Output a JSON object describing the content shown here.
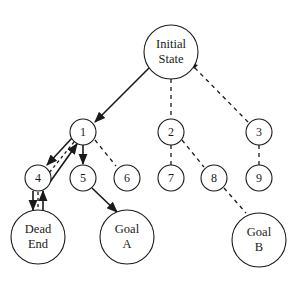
{
  "diagram": {
    "type": "search-tree",
    "colors": {
      "stroke": "#1a1a1a",
      "background": "#ffffff"
    },
    "nodes": {
      "root": {
        "line1": "Initial",
        "line2": "State"
      },
      "n1": "1",
      "n2": "2",
      "n3": "3",
      "n4": "4",
      "n5": "5",
      "n6": "6",
      "n7": "7",
      "n8": "8",
      "n9": "9",
      "dead_end": {
        "line1": "Dead",
        "line2": "End"
      },
      "goal_a": {
        "line1": "Goal",
        "line2": "A"
      },
      "goal_b": {
        "line1": "Goal",
        "line2": "B"
      }
    },
    "edges": [
      {
        "from": "Initial State",
        "to": "1",
        "style": "solid-arrow"
      },
      {
        "from": "Initial State",
        "to": "2",
        "style": "dashed"
      },
      {
        "from": "Initial State",
        "to": "3",
        "style": "dashed"
      },
      {
        "from": "1",
        "to": "4",
        "style": "solid-arrow"
      },
      {
        "from": "4",
        "to": "1",
        "style": "solid-arrow-backtrack"
      },
      {
        "from": "1",
        "to": "5",
        "style": "solid-arrow"
      },
      {
        "from": "1",
        "to": "6",
        "style": "dashed"
      },
      {
        "from": "2",
        "to": "7",
        "style": "dashed"
      },
      {
        "from": "2",
        "to": "8",
        "style": "dashed"
      },
      {
        "from": "3",
        "to": "9",
        "style": "dashed"
      },
      {
        "from": "4",
        "to": "Dead End",
        "style": "solid-arrow"
      },
      {
        "from": "Dead End",
        "to": "4",
        "style": "solid-arrow-backtrack"
      },
      {
        "from": "5",
        "to": "Goal A",
        "style": "solid-arrow"
      },
      {
        "from": "8",
        "to": "Goal B",
        "style": "dashed"
      }
    ]
  }
}
